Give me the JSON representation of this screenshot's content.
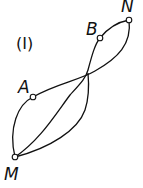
{
  "figure": {
    "title": "(I)",
    "points": [
      {
        "id": "N",
        "label": "N"
      },
      {
        "id": "B",
        "label": "B"
      },
      {
        "id": "A",
        "label": "A"
      },
      {
        "id": "M",
        "label": "M"
      }
    ],
    "curves": [
      {
        "name": "curve-M-A-N",
        "through": [
          "M",
          "A",
          "crossing",
          "N"
        ]
      },
      {
        "name": "curve-M-crossing-N",
        "through": [
          "M",
          "crossing",
          "N"
        ]
      },
      {
        "name": "curve-M-crossing-B-N",
        "through": [
          "M",
          "crossing",
          "B",
          "N"
        ]
      }
    ]
  }
}
